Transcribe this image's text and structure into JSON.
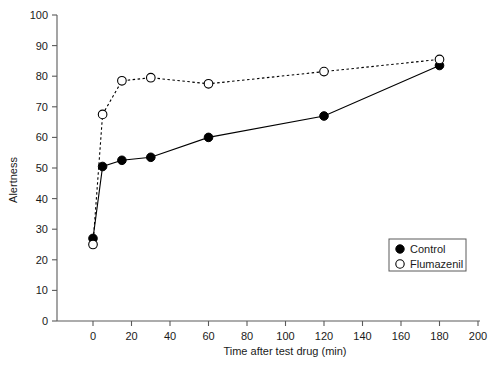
{
  "chart_data": {
    "type": "line",
    "title": "",
    "xlabel": "Time after test drug (min)",
    "ylabel": "Alertness",
    "xlim": [
      0,
      200
    ],
    "ylim": [
      0,
      100
    ],
    "xticks": [
      0,
      20,
      40,
      60,
      80,
      100,
      120,
      140,
      160,
      180,
      200
    ],
    "yticks": [
      0,
      10,
      20,
      30,
      40,
      50,
      60,
      70,
      80,
      90,
      100
    ],
    "grid": false,
    "legend_position": "lower right",
    "x": [
      0,
      5,
      15,
      30,
      60,
      120,
      180
    ],
    "series": [
      {
        "name": "Control",
        "marker": "filled-circle",
        "linestyle": "solid",
        "color": "#000000",
        "values": [
          27,
          50.5,
          52.5,
          53.5,
          60,
          67,
          83.5
        ]
      },
      {
        "name": "Flumazenil",
        "marker": "open-circle",
        "linestyle": "dashed",
        "color": "#000000",
        "values": [
          25,
          67.5,
          78.5,
          79.5,
          77.5,
          81.5,
          85.5
        ]
      }
    ]
  },
  "axes": {
    "x_title": "Time after test drug (min)",
    "y_title": "Alertness",
    "x_tick_labels": [
      "0",
      "20",
      "40",
      "60",
      "80",
      "100",
      "120",
      "140",
      "160",
      "180",
      "200"
    ],
    "y_tick_labels": [
      "0",
      "10",
      "20",
      "30",
      "40",
      "50",
      "60",
      "70",
      "80",
      "90",
      "100"
    ]
  },
  "legend": {
    "entries": [
      {
        "label": "Control",
        "marker": "filled-circle"
      },
      {
        "label": "Flumazenil",
        "marker": "open-circle"
      }
    ]
  },
  "colors": {
    "axis": "#5a5a5a",
    "ink": "#1a1a1a",
    "series": "#000000",
    "background": "#ffffff"
  }
}
